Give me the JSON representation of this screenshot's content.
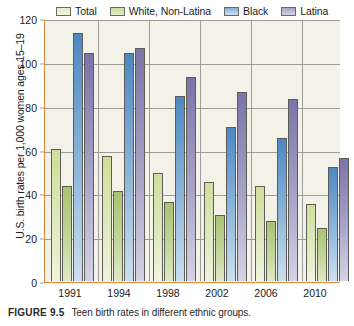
{
  "caption": {
    "figure_number": "FIGURE 9.5",
    "text": "Teen birth rates in different ethnic groups."
  },
  "colors": {
    "plot_background": "#f4f1e8",
    "axis": "#e08a3c",
    "gridline": "#9d9d95",
    "total": "#cfdf9a",
    "white_non_latina": "#a8c473",
    "black": "#4d88c4",
    "latina": "#7a74a8"
  },
  "chart_data": {
    "type": "bar",
    "title": "",
    "xlabel": "",
    "ylabel": "U.S. birth rates per 1,000 women ages 15–19",
    "ylim": [
      0,
      120
    ],
    "yticks": [
      0,
      20,
      40,
      60,
      80,
      100,
      120
    ],
    "grid": true,
    "legend_position": "top",
    "categories": [
      "1991",
      "1994",
      "1998",
      "2002",
      "2006",
      "2010"
    ],
    "series": [
      {
        "name": "Total",
        "color": "#cfdf9a",
        "values": [
          60,
          57,
          49,
          45,
          43,
          35
        ]
      },
      {
        "name": "White, Non-Latina",
        "color": "#a8c473",
        "values": [
          43,
          41,
          36,
          30,
          27,
          24
        ]
      },
      {
        "name": "Black",
        "color": "#4d88c4",
        "values": [
          113,
          104,
          84,
          70,
          65,
          52
        ]
      },
      {
        "name": "Latina",
        "color": "#7a74a8",
        "values": [
          104,
          106,
          93,
          86,
          83,
          56
        ]
      }
    ]
  }
}
